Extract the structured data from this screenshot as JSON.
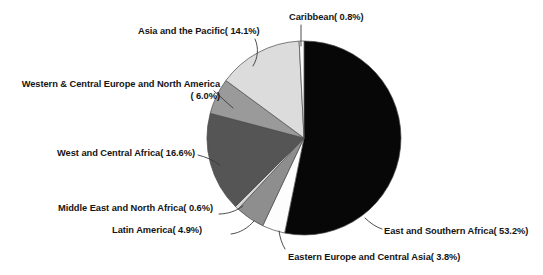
{
  "chart_data": {
    "type": "pie",
    "title": "",
    "subtitle": "",
    "xlabel": "",
    "ylabel": "",
    "legend_position": "callout-labels",
    "grid": false,
    "label_format": "{name}( {value}%)",
    "total_percent": 100.0,
    "categories": [
      "East and Southern Africa",
      "West and Central Africa",
      "Asia and the Pacific",
      "Western & Central Europe and North America",
      "Latin America",
      "Eastern Europe and Central Asia",
      "Caribbean",
      "Middle East and North Africa"
    ],
    "values": [
      53.2,
      16.6,
      14.1,
      6.0,
      4.9,
      3.8,
      0.8,
      0.6
    ],
    "slices": [
      {
        "name": "East and Southern Africa",
        "value": 53.2,
        "label": "East and Southern Africa( 53.2%)",
        "color": "#070707",
        "start_angle": 0.0,
        "end_angle": 191.52
      },
      {
        "name": "Eastern Europe and Central Asia",
        "value": 3.8,
        "label": "Eastern Europe and Central Asia( 3.8%)",
        "color": "#fdfdfd",
        "start_angle": 191.52,
        "end_angle": 205.2
      },
      {
        "name": "Latin America",
        "value": 4.9,
        "label": "Latin America( 4.9%)",
        "color": "#8e8e8e",
        "start_angle": 205.2,
        "end_angle": 222.84
      },
      {
        "name": "Middle East and North Africa",
        "value": 0.6,
        "label": "Middle East and North Africa( 0.6%)",
        "color": "#d6d6d6",
        "start_angle": 222.84,
        "end_angle": 225.0
      },
      {
        "name": "West and Central Africa",
        "value": 16.6,
        "label": "West and Central Africa( 16.6%)",
        "color": "#555555",
        "start_angle": 225.0,
        "end_angle": 284.76
      },
      {
        "name": "Western & Central Europe and North America",
        "value": 6.0,
        "label_line1": "Western & Central Europe and North America",
        "label_line2": "( 6.0%)",
        "color": "#9a9a9a",
        "start_angle": 284.76,
        "end_angle": 306.36
      },
      {
        "name": "Asia and the Pacific",
        "value": 14.1,
        "label": "Asia and the Pacific( 14.1%)",
        "color": "#dcdcdc",
        "start_angle": 306.36,
        "end_angle": 357.12
      },
      {
        "name": "Caribbean",
        "value": 0.8,
        "label": "Caribbean( 0.8%)",
        "color": "#fbfbfb",
        "start_angle": 357.12,
        "end_angle": 360.0
      }
    ],
    "colors": {
      "east_southern_africa": "#070707",
      "west_central_africa": "#555555",
      "asia_pacific": "#dcdcdc",
      "wc_europe_north_america": "#9a9a9a",
      "latin_america": "#8e8e8e",
      "eastern_europe_central_asia": "#fdfdfd",
      "caribbean": "#fbfbfb",
      "middle_east_north_africa": "#d6d6d6",
      "outline": "#4a4a4a",
      "leader_line": "#3a3a3a",
      "background": "#ffffff",
      "text": "#141414"
    },
    "geometry": {
      "center_x": 304,
      "center_y": 138,
      "radius": 97
    }
  },
  "labels": {
    "caribbean": "Caribbean( 0.8%)",
    "asia_pacific": "Asia and the Pacific( 14.1%)",
    "wc_europe_line1": "Western & Central Europe and North America",
    "wc_europe_line2": "( 6.0%)",
    "wc_africa": "West and Central Africa( 16.6%)",
    "middle_east": "Middle East and North Africa( 0.6%)",
    "latin_america": "Latin America( 4.9%)",
    "eastern_europe": "Eastern Europe and Central Asia( 3.8%)",
    "east_southern_africa": "East and Southern Africa( 53.2%)"
  }
}
